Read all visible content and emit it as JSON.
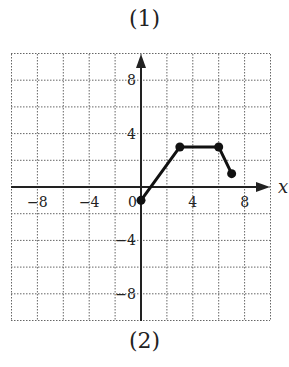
{
  "captions": {
    "top": "(1)",
    "bottom": "(2)"
  },
  "chart_data": {
    "type": "line",
    "title": "",
    "xlabel": "x",
    "ylabel": "",
    "xlim": [
      -10,
      10
    ],
    "ylim": [
      -10,
      10
    ],
    "grid": true,
    "grid_step": 2,
    "x_ticks": [
      "-8",
      "-4",
      "0",
      "4",
      "8"
    ],
    "y_ticks": [
      "8",
      "4",
      "-4",
      "-8"
    ],
    "series": [
      {
        "name": "graph",
        "points": [
          [
            0,
            -1
          ],
          [
            3,
            3
          ],
          [
            6,
            3
          ],
          [
            7,
            1
          ]
        ]
      }
    ]
  }
}
